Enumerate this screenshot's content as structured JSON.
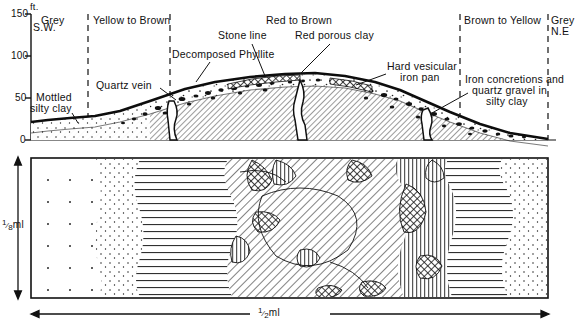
{
  "figure": {
    "axis": {
      "unit_label": "ft.",
      "ticks": [
        {
          "value": 150,
          "label": "150"
        },
        {
          "value": 100,
          "label": "100"
        },
        {
          "value": 50,
          "label": "50"
        },
        {
          "value": 0,
          "label": "0"
        }
      ],
      "ylim": [
        0,
        150
      ]
    },
    "direction_markers": {
      "left": "S.W.",
      "right": "N.E"
    },
    "colour_zones": [
      {
        "label": "Grey",
        "x_center": 58
      },
      {
        "label": "Yellow to Brown",
        "x_center": 129
      },
      {
        "label": "Red to Brown",
        "x_center": 315
      },
      {
        "label": "Brown to Yellow",
        "x_center": 504
      },
      {
        "label": "Grey",
        "x_center": 562
      }
    ],
    "zone_boundaries_x": [
      88,
      170,
      460,
      548
    ],
    "annotations": [
      {
        "name": "mottled-silty-clay",
        "lines": [
          "Mottled",
          "silty clay"
        ],
        "x": 38,
        "y": 95
      },
      {
        "name": "quartz-vein",
        "lines": [
          "Quartz vein"
        ],
        "x": 100,
        "y": 82
      },
      {
        "name": "decomposed-phyllite",
        "lines": [
          "Decomposed Phyllite"
        ],
        "x": 168,
        "y": 52
      },
      {
        "name": "stone-line",
        "lines": [
          "Stone line"
        ],
        "x": 225,
        "y": 32
      },
      {
        "name": "red-porous-clay",
        "lines": [
          "Red porous clay"
        ],
        "x": 300,
        "y": 32
      },
      {
        "name": "hard-vesicular-iron-pan",
        "lines": [
          "Hard vesicular",
          "iron pan"
        ],
        "x": 388,
        "y": 60
      },
      {
        "name": "iron-concretions",
        "lines": [
          "Iron concretions and",
          "quartz gravel in",
          "silty clay"
        ],
        "x": 466,
        "y": 82
      }
    ],
    "scale_bars": {
      "vertical_label": "⅛ml",
      "vertical_label_parts": {
        "numerator": "1",
        "denominator": "8",
        "unit": "ml"
      },
      "horizontal_label": "½ ml",
      "horizontal_label_parts": {
        "numerator": "1",
        "denominator": "2",
        "unit": "ml"
      }
    },
    "plan_panel": {
      "name": "plan-view-panel",
      "frame": {
        "x": 31,
        "y": 158,
        "width": 517,
        "height": 140
      },
      "pattern_zones": [
        {
          "name": "dotted-sparse-grey",
          "pattern": "sparse-dots"
        },
        {
          "name": "dense-stipple-yellow",
          "pattern": "dense-stipple"
        },
        {
          "name": "horizontal-ruled-brown",
          "pattern": "horizontal-lines"
        },
        {
          "name": "diagonal-hatch-red",
          "pattern": "diagonal-hatch"
        },
        {
          "name": "cross-hatch-ironpan",
          "pattern": "cross-hatch"
        },
        {
          "name": "vertical-ruled-quartz",
          "pattern": "vertical-lines"
        }
      ]
    },
    "colors": {
      "ink": "#111111",
      "paper": "#ffffff",
      "hatch": "#222222"
    }
  }
}
